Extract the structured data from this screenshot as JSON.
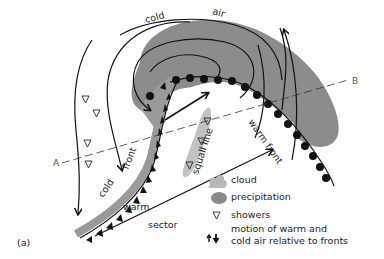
{
  "figure": {
    "panel_label": "(a)",
    "labels": {
      "cold": "cold",
      "air": "air",
      "cold_front_cold": "cold",
      "cold_front_front": "front",
      "warm_front": "warm front",
      "squall_line": "squall line",
      "warm": "warm",
      "sector": "sector",
      "section_start": "A",
      "section_end": "B"
    },
    "colors": {
      "cloud": "#b8b8b8",
      "precipitation": "#8a8a8a",
      "front_band": "#9a9a9a",
      "lines": "#111111"
    }
  },
  "legend": {
    "items": [
      {
        "icon": "cloud-swatch",
        "label": "cloud"
      },
      {
        "icon": "precipitation-swatch",
        "label": "precipitation"
      },
      {
        "icon": "shower-triangle-icon",
        "label": "showers"
      },
      {
        "icon": "up-down-arrows-icon",
        "label": "motion of warm and",
        "label2": "cold air relative to fronts"
      }
    ]
  }
}
